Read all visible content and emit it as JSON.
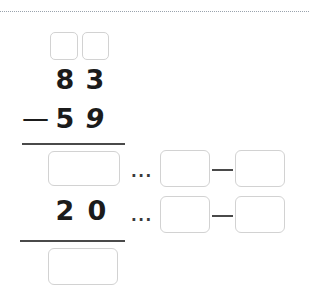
{
  "worksheet": {
    "type": "vertical-subtraction-exercise",
    "problem": {
      "minuend": "83",
      "subtrahend": "59",
      "operator": "—",
      "partial_result": "20"
    },
    "minuend_digits": {
      "tens": "8",
      "ones": "3"
    },
    "subtrahend_digits": {
      "tens": "5",
      "ones": "9"
    },
    "partial_digits": {
      "tens": "2",
      "ones": "0"
    },
    "ellipsis": "...",
    "connector_dash": "",
    "regroup_boxes": [
      {
        "name": "regroup-tens-box",
        "value": ""
      },
      {
        "name": "regroup-ones-box",
        "value": ""
      }
    ],
    "answer_boxes": [
      {
        "name": "ones-step-answer-box",
        "value": ""
      },
      {
        "name": "final-answer-box",
        "value": ""
      }
    ],
    "decomposition_rows": [
      {
        "name": "decomposition-row-1",
        "left_box": {
          "name": "decomposition-row-1-left-box",
          "value": ""
        },
        "right_box": {
          "name": "decomposition-row-1-right-box",
          "value": ""
        }
      },
      {
        "name": "decomposition-row-2",
        "left_box": {
          "name": "decomposition-row-2-left-box",
          "value": ""
        },
        "right_box": {
          "name": "decomposition-row-2-right-box",
          "value": ""
        }
      }
    ],
    "colors": {
      "box_border": "#d2d2d2",
      "rule": "#4a4a4a",
      "digit": "#1b1b1b",
      "dotted_rule": "#9aa3ad",
      "page_background": "#ffffff"
    }
  }
}
